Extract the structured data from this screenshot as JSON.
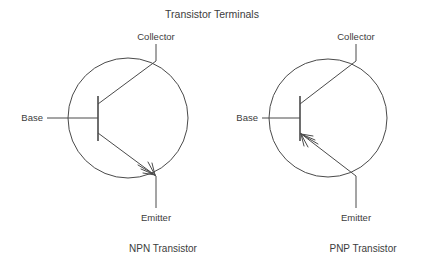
{
  "figure": {
    "title": "Transistor Terminals",
    "background_color": "#ffffff",
    "line_color": "#4a4a4a",
    "text_color": "#3c3c3c"
  },
  "diagrams": [
    {
      "id": "npn",
      "caption": "NPN Transistor",
      "type": "NPN",
      "arrow_direction": "outward-on-emitter",
      "terminals": {
        "base": "Base",
        "collector": "Collector",
        "emitter": "Emitter"
      },
      "envelope": {
        "cx": 128,
        "cy": 118,
        "r": 60
      }
    },
    {
      "id": "pnp",
      "caption": "PNP Transistor",
      "type": "PNP",
      "arrow_direction": "inward-toward-base",
      "terminals": {
        "base": "Base",
        "collector": "Collector",
        "emitter": "Emitter"
      },
      "envelope": {
        "cx": 328,
        "cy": 118,
        "r": 59
      }
    }
  ]
}
